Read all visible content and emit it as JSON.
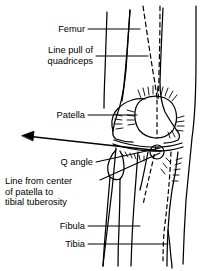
{
  "figure": {
    "view": "anterior view of right knee",
    "background_color": "#ffffff",
    "line_color": "#000000",
    "labels": [
      {
        "id": "femur",
        "text": "Femur",
        "align": "right",
        "x": 85,
        "y": 25,
        "leader": "horizontal"
      },
      {
        "id": "line-pull-quadriceps",
        "text": "Line pull of\nquadriceps",
        "align": "right",
        "x": 93,
        "y": 48,
        "leader": "horizontal"
      },
      {
        "id": "patella",
        "text": "Patella",
        "align": "right",
        "x": 85,
        "y": 111,
        "leader": "horizontal"
      },
      {
        "id": "q-angle",
        "text": "Q angle",
        "align": "right",
        "x": 93,
        "y": 158,
        "leader": "diagonal"
      },
      {
        "id": "line-center-patella",
        "text": "Line from center\nof patella to\ntibial tuberosity",
        "align": "left",
        "x": 5,
        "y": 178,
        "leader": "diagonal"
      },
      {
        "id": "fibula",
        "text": "Fibula",
        "align": "right",
        "x": 85,
        "y": 222,
        "leader": "horizontal"
      },
      {
        "id": "tibia",
        "text": "Tibia",
        "align": "right",
        "x": 85,
        "y": 240,
        "leader": "horizontal"
      }
    ],
    "markers": [
      {
        "id": "tibial-tuberosity-circle",
        "shape": "circle",
        "cx": 157,
        "cy": 152,
        "r": 7
      },
      {
        "id": "q-angle-arrow",
        "shape": "arrow",
        "from_x": 160,
        "from_y": 151,
        "to_x": 22,
        "to_y": 136
      }
    ],
    "structures": [
      "femur-shaft",
      "femoral-condyles",
      "patella",
      "tibial-plateau",
      "tibia-shaft",
      "fibula-head",
      "fibula-shaft",
      "quadriceps-dashed-line",
      "patellar-tendon-dashed-line"
    ]
  }
}
